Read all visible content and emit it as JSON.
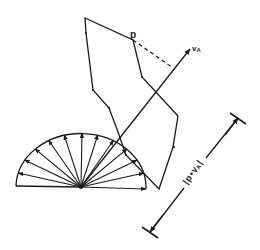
{
  "diagram": {
    "labels": {
      "point": "p",
      "vector": "v",
      "vector_sub": "A",
      "measure_left_bar": "|",
      "measure_p": "p",
      "measure_dot": "•",
      "measure_v": "v",
      "measure_sub": "A",
      "measure_right_bar": "|"
    },
    "colors": {
      "stroke": "#1a1a1a",
      "background": "#ffffff"
    },
    "polygon": [
      [
        85,
        18
      ],
      [
        133,
        40
      ],
      [
        142,
        77
      ],
      [
        178,
        116
      ],
      [
        173,
        147
      ],
      [
        159,
        189
      ],
      [
        126,
        155
      ],
      [
        118,
        132
      ],
      [
        109,
        108
      ],
      [
        93,
        90
      ],
      [
        86,
        33
      ]
    ],
    "polygon_ticks": [
      [
        86,
        33
      ],
      [
        93,
        90
      ],
      [
        109,
        108
      ],
      [
        142,
        77
      ],
      [
        174,
        147
      ],
      [
        126,
        155
      ]
    ],
    "half_disk": {
      "cx": 81,
      "cy": 187,
      "rx": 65,
      "ry": 54,
      "spoke_count": 13
    },
    "vector_arrow": {
      "from": [
        81,
        187
      ],
      "to": [
        190,
        49
      ]
    },
    "projection_dashed": {
      "from": [
        133,
        40
      ],
      "to": [
        173,
        68
      ]
    },
    "dimension_line": {
      "from": [
        150,
        232
      ],
      "to": [
        238,
        118
      ]
    }
  }
}
